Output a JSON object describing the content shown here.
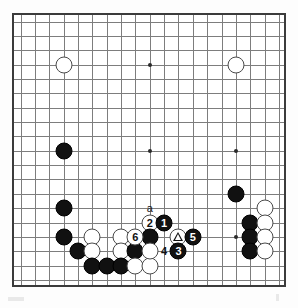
{
  "figure": {
    "kind": "go-board-diagram",
    "board_size": 19,
    "line_color": "#7d7d7d",
    "border_color": "#3b3b3b",
    "black_color": "#111111",
    "white_color": "#ffffff"
  },
  "hoshi": [
    {
      "col": 3,
      "row": 3
    },
    {
      "col": 9,
      "row": 3
    },
    {
      "col": 15,
      "row": 3
    },
    {
      "col": 3,
      "row": 9
    },
    {
      "col": 9,
      "row": 9
    },
    {
      "col": 15,
      "row": 9
    },
    {
      "col": 3,
      "row": 15
    },
    {
      "col": 9,
      "row": 15
    },
    {
      "col": 15,
      "row": 15
    }
  ],
  "stones": [
    {
      "col": 3,
      "row": 3,
      "color": "white"
    },
    {
      "col": 15,
      "row": 3,
      "color": "white"
    },
    {
      "col": 3,
      "row": 9,
      "color": "black"
    },
    {
      "col": 3,
      "row": 13,
      "color": "black"
    },
    {
      "col": 3,
      "row": 15,
      "color": "black"
    },
    {
      "col": 4,
      "row": 16,
      "color": "black"
    },
    {
      "col": 5,
      "row": 15,
      "color": "white"
    },
    {
      "col": 5,
      "row": 16,
      "color": "white"
    },
    {
      "col": 5,
      "row": 17,
      "color": "black"
    },
    {
      "col": 6,
      "row": 17,
      "color": "black"
    },
    {
      "col": 7,
      "row": 15,
      "color": "white"
    },
    {
      "col": 7,
      "row": 16,
      "color": "white"
    },
    {
      "col": 7,
      "row": 17,
      "color": "black"
    },
    {
      "col": 8,
      "row": 16,
      "color": "black"
    },
    {
      "col": 8,
      "row": 17,
      "color": "white"
    },
    {
      "col": 9,
      "row": 17,
      "color": "white"
    },
    {
      "col": 9,
      "row": 14,
      "color": "white"
    },
    {
      "col": 9,
      "row": 15,
      "color": "black"
    },
    {
      "col": 10,
      "row": 14,
      "color": "black"
    },
    {
      "col": 11,
      "row": 15,
      "color": "white"
    },
    {
      "col": 11,
      "row": 16,
      "color": "black"
    },
    {
      "col": 12,
      "row": 15,
      "color": "black"
    },
    {
      "col": 8,
      "row": 15,
      "color": "white"
    },
    {
      "col": 9,
      "row": 16,
      "color": "white"
    },
    {
      "col": 15,
      "row": 12,
      "color": "black"
    },
    {
      "col": 17,
      "row": 13,
      "color": "white"
    },
    {
      "col": 16,
      "row": 14,
      "color": "black"
    },
    {
      "col": 17,
      "row": 14,
      "color": "white"
    },
    {
      "col": 16,
      "row": 15,
      "color": "black"
    },
    {
      "col": 17,
      "row": 15,
      "color": "white"
    },
    {
      "col": 16,
      "row": 16,
      "color": "black"
    },
    {
      "col": 17,
      "row": 16,
      "color": "white"
    }
  ],
  "move_markers": [
    {
      "label": "1",
      "col": 10,
      "row": 14,
      "on": "black"
    },
    {
      "label": "2",
      "col": 9,
      "row": 14,
      "on": "white"
    },
    {
      "label": "3",
      "col": 11,
      "row": 16,
      "on": "black"
    },
    {
      "label": "4",
      "col": 10,
      "row": 16,
      "on": "white"
    },
    {
      "label": "5",
      "col": 12,
      "row": 15,
      "on": "black"
    },
    {
      "label": "6",
      "col": 8,
      "row": 15,
      "on": "white"
    }
  ],
  "point_labels": [
    {
      "label": "a",
      "col": 9,
      "row": 13
    }
  ],
  "triangle_marks": [
    {
      "col": 11,
      "row": 15,
      "on": "white"
    }
  ]
}
